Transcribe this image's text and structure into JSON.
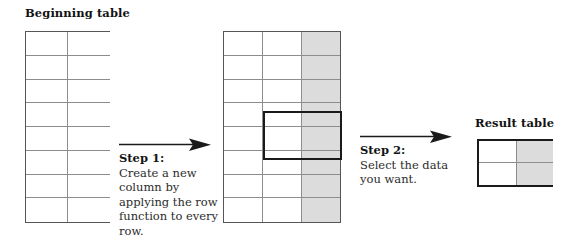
{
  "diagram": {
    "type": "process-flow",
    "background_color": "#ffffff",
    "ink_color": "#1a1a1a",
    "shade_color": "#dcdcdc",
    "grid_line_color": "#8d8d8d"
  },
  "beginning_table": {
    "title": "Beginning table",
    "columns": 2,
    "rows": 8,
    "shaded_columns": [],
    "cells_empty": true
  },
  "middle_table": {
    "title": "",
    "columns": 3,
    "rows": 8,
    "shaded_columns": [
      3
    ],
    "cells_empty": true,
    "selection": {
      "label": "selected-range",
      "start_row": 4,
      "end_row": 5,
      "start_column": 2,
      "end_column": 3,
      "border_color": "#1a1a1a"
    }
  },
  "result_table": {
    "title": "Result table",
    "columns": 2,
    "rows": 2,
    "shaded_columns": [
      2
    ],
    "cells_empty": true,
    "border_color": "#1a1a1a"
  },
  "steps": [
    {
      "id": "step-1",
      "heading": "Step 1:",
      "body": "Create a new column by applying the row function to every row.",
      "arrow": "arrow-right"
    },
    {
      "id": "step-2",
      "heading": "Step 2:",
      "body": "Select the data you want.",
      "arrow": "arrow-right"
    }
  ]
}
